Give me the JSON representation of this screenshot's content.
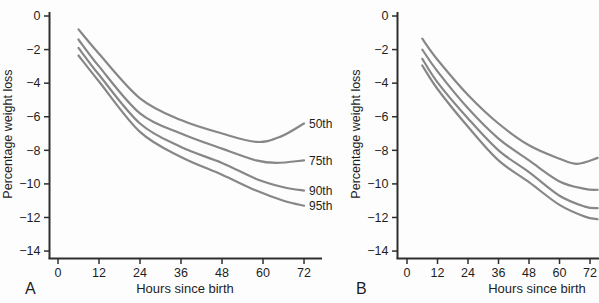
{
  "figure": {
    "background": "#fdfdfd",
    "curve_color": "#878787",
    "axis_color": "#2e2e2e",
    "text_color": "#1e1e1e"
  },
  "chart_data": [
    {
      "type": "line",
      "panel_label": "A",
      "xlabel": "Hours since birth",
      "ylabel": "Percentage weight loss",
      "x_ticks": [
        0,
        12,
        24,
        36,
        48,
        60,
        72
      ],
      "y_ticks": [
        0,
        -2,
        -4,
        -6,
        -8,
        -10,
        -12,
        -14
      ],
      "xlim": [
        0,
        77
      ],
      "ylim": [
        -14.5,
        0.5
      ],
      "grid": false,
      "legend_position": "curve-end-labels-right",
      "series": [
        {
          "name": "50th",
          "label": "50th",
          "points": [
            [
              6,
              -0.8
            ],
            [
              12,
              -2.25
            ],
            [
              24,
              -4.9
            ],
            [
              36,
              -6.2
            ],
            [
              48,
              -7.0
            ],
            [
              58,
              -7.5
            ],
            [
              65,
              -7.2
            ],
            [
              72,
              -6.4
            ]
          ]
        },
        {
          "name": "75th",
          "label": "75th",
          "points": [
            [
              6,
              -1.4
            ],
            [
              12,
              -3.0
            ],
            [
              24,
              -5.8
            ],
            [
              36,
              -7.0
            ],
            [
              48,
              -7.9
            ],
            [
              58,
              -8.6
            ],
            [
              64,
              -8.75
            ],
            [
              72,
              -8.6
            ]
          ]
        },
        {
          "name": "90th",
          "label": "90th",
          "points": [
            [
              6,
              -1.9
            ],
            [
              12,
              -3.5
            ],
            [
              24,
              -6.4
            ],
            [
              36,
              -7.8
            ],
            [
              48,
              -8.75
            ],
            [
              58,
              -9.7
            ],
            [
              66,
              -10.2
            ],
            [
              72,
              -10.4
            ]
          ]
        },
        {
          "name": "95th",
          "label": "95th",
          "points": [
            [
              6,
              -2.35
            ],
            [
              12,
              -3.9
            ],
            [
              24,
              -6.9
            ],
            [
              36,
              -8.4
            ],
            [
              48,
              -9.45
            ],
            [
              58,
              -10.4
            ],
            [
              66,
              -11.0
            ],
            [
              72,
              -11.3
            ]
          ]
        }
      ]
    },
    {
      "type": "line",
      "panel_label": "B",
      "xlabel": "Hours since birth",
      "ylabel": "Percentage weight loss",
      "x_ticks": [
        0,
        12,
        24,
        36,
        48,
        60,
        72
      ],
      "y_ticks": [
        0,
        -2,
        -4,
        -6,
        -8,
        -10,
        -12,
        -14
      ],
      "xlim": [
        0,
        75.5
      ],
      "ylim": [
        -14.5,
        0.5
      ],
      "grid": false,
      "legend_position": "none-labels-cut-off",
      "series": [
        {
          "name": "50th",
          "label": "",
          "points": [
            [
              6,
              -1.35
            ],
            [
              12,
              -2.6
            ],
            [
              24,
              -4.7
            ],
            [
              36,
              -6.4
            ],
            [
              48,
              -7.7
            ],
            [
              60,
              -8.5
            ],
            [
              67,
              -8.8
            ],
            [
              75,
              -8.45
            ]
          ]
        },
        {
          "name": "75th",
          "label": "",
          "points": [
            [
              6,
              -2.0
            ],
            [
              12,
              -3.3
            ],
            [
              24,
              -5.5
            ],
            [
              36,
              -7.3
            ],
            [
              48,
              -8.6
            ],
            [
              60,
              -9.85
            ],
            [
              70,
              -10.3
            ],
            [
              75,
              -10.35
            ]
          ]
        },
        {
          "name": "90th",
          "label": "",
          "points": [
            [
              6,
              -2.55
            ],
            [
              12,
              -3.95
            ],
            [
              24,
              -6.1
            ],
            [
              36,
              -8.0
            ],
            [
              48,
              -9.3
            ],
            [
              60,
              -10.7
            ],
            [
              70,
              -11.35
            ],
            [
              75,
              -11.45
            ]
          ]
        },
        {
          "name": "95th",
          "label": "",
          "points": [
            [
              6,
              -2.95
            ],
            [
              12,
              -4.35
            ],
            [
              24,
              -6.6
            ],
            [
              36,
              -8.6
            ],
            [
              48,
              -9.9
            ],
            [
              60,
              -11.25
            ],
            [
              70,
              -11.95
            ],
            [
              75,
              -12.1
            ]
          ]
        }
      ]
    }
  ]
}
